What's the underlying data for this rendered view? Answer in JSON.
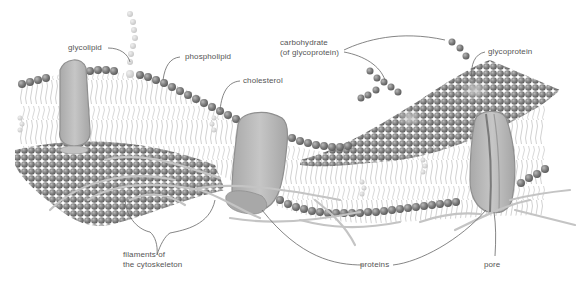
{
  "diagram": {
    "colors": {
      "head": "#8a8a8a",
      "head_dark": "#6e6e6e",
      "head_light": "#cfcfcf",
      "tail": "#bdbdbd",
      "protein": "#bdbdbd",
      "protein_edge": "#8f8f8f",
      "filament": "#c4c4c4",
      "leader": "#666666",
      "label": "#555555"
    },
    "labels": {
      "glycolipid": "glycolipid",
      "phospholipid": "phospholipid",
      "cholesterol": "cholesterol",
      "carbohydrate_line1": "carbohydrate",
      "carbohydrate_line2": "(of glycoprotein)",
      "glycoprotein": "glycoprotein",
      "filaments_line1": "filaments of",
      "filaments_line2": "the cytoskeleton",
      "proteins": "proteins",
      "pore": "pore"
    }
  }
}
